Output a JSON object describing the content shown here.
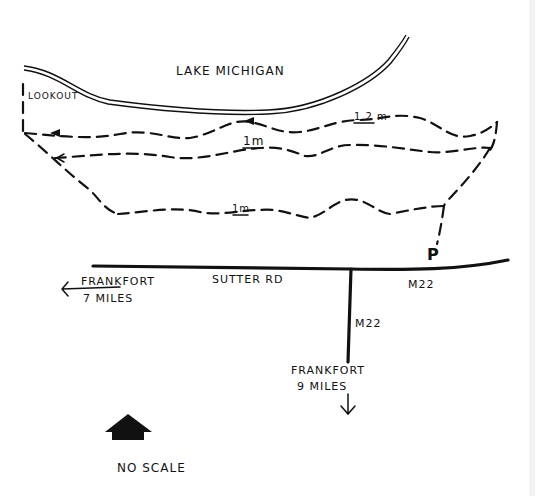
{
  "map": {
    "water_label": "LAKE MICHIGAN",
    "lookout_label": "LOOKOUT",
    "trail_labels": {
      "upper_loop": "1.2 m",
      "middle_loop": "1m",
      "lower_loop": "1m"
    },
    "parking_label": "P",
    "roads": {
      "main_road_name": "SUTTER RD",
      "east_road_name": "M22",
      "south_road_name": "M22"
    },
    "directions": {
      "west": {
        "line1": "FRANKFORT",
        "line2": "7 MILES"
      },
      "south": {
        "line1": "FRANKFORT",
        "line2": "9 MILES"
      }
    },
    "north_arrow_icon": "north-arrow-icon",
    "scale_note": "NO SCALE",
    "colors": {
      "ink": "#111111",
      "paper": "#ffffff"
    }
  }
}
